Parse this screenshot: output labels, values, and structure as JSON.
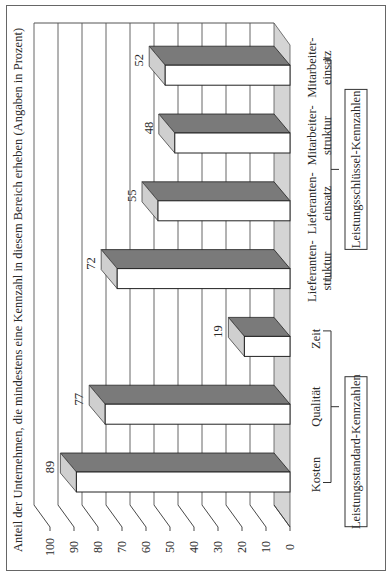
{
  "chart_data": {
    "type": "bar",
    "orientation": "rotated-90-ccw",
    "three_d": true,
    "ylabel": "Anteil der Unternehmen, die mindestens eine Kennzahl in diesem Bereich erheben (Angaben in Prozent)",
    "xlabel": "",
    "ylim": [
      0,
      100
    ],
    "yticks": [
      0,
      10,
      20,
      30,
      40,
      50,
      60,
      70,
      80,
      90,
      100
    ],
    "grid": true,
    "categories": [
      [
        "Kosten"
      ],
      [
        "Qualität"
      ],
      [
        "Zeit"
      ],
      [
        "Lieferanten-",
        "struktur"
      ],
      [
        "Lieferanten-",
        "einsatz"
      ],
      [
        "Mitarbeiter-",
        "struktur"
      ],
      [
        "Mitarbeiter-",
        "einsatz"
      ]
    ],
    "values": [
      89,
      77,
      19,
      72,
      55,
      48,
      52
    ],
    "groups": [
      {
        "label": "Leistungsstandard-Kennzahlen",
        "from": 0,
        "to": 2
      },
      {
        "label": "Leistungsschlüssel-Kennzahlen",
        "from": 3,
        "to": 6
      }
    ],
    "colors": {
      "bar_front": "#ffffff",
      "bar_top": "#7a7a7a",
      "bar_side": "#cfcfcf",
      "floor": "#d4d4d4",
      "grid": "#555555",
      "frame": "#666666"
    }
  }
}
